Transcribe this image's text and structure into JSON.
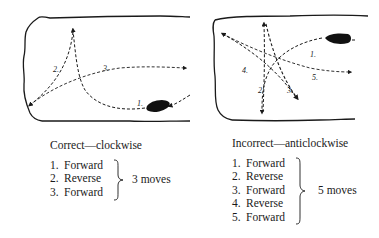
{
  "left_panel": {
    "caption": "Correct—clockwise",
    "steps": [
      {
        "num": "1.",
        "label": "Forward"
      },
      {
        "num": "2.",
        "label": "Reverse"
      },
      {
        "num": "3.",
        "label": "Forward"
      }
    ],
    "total": "3 moves",
    "path_labels": [
      "1.",
      "2.",
      "3."
    ]
  },
  "right_panel": {
    "caption": "Incorrect—anticlockwise",
    "steps": [
      {
        "num": "1.",
        "label": "Forward"
      },
      {
        "num": "2.",
        "label": "Reverse"
      },
      {
        "num": "3.",
        "label": "Forward"
      },
      {
        "num": "4.",
        "label": "Reverse"
      },
      {
        "num": "5.",
        "label": "Forward"
      }
    ],
    "total": "5 moves",
    "path_labels": [
      "1.",
      "2.",
      "3.",
      "4.",
      "5."
    ]
  },
  "colors": {
    "ink": "#1a1a1a",
    "background": "#ffffff"
  }
}
